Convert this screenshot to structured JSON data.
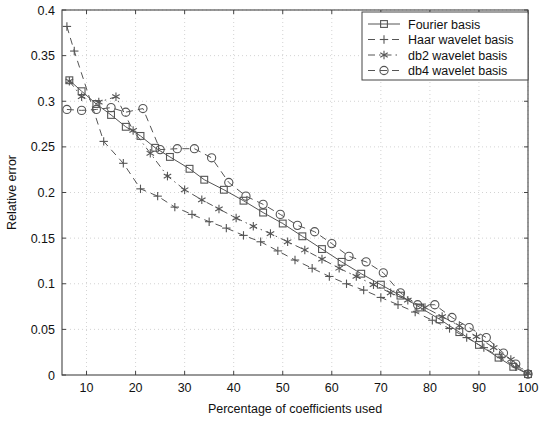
{
  "chart_data": {
    "type": "line",
    "title": "",
    "xlabel": "Percentage of coefficients used",
    "ylabel": "Relative error",
    "xlim": [
      5,
      100
    ],
    "ylim": [
      0,
      0.4
    ],
    "xticks": [
      10,
      20,
      30,
      40,
      50,
      60,
      70,
      80,
      90,
      100
    ],
    "xtick_labels": [
      "10",
      "20",
      "30",
      "40",
      "50",
      "60",
      "70",
      "80",
      "90",
      "100"
    ],
    "yticks": [
      0,
      0.05,
      0.1,
      0.15,
      0.2,
      0.25,
      0.3,
      0.35,
      0.4
    ],
    "ytick_labels": [
      "0",
      "0.05",
      "0.1",
      "0.15",
      "0.2",
      "0.25",
      "0.3",
      "0.35",
      "0.4"
    ],
    "grid": true,
    "grid_style": "dotted",
    "legend_position": "top-right",
    "line_color": "#555555",
    "grid_color": "#c8c8c8",
    "axis_color": "#444444",
    "series": [
      {
        "name": "Fourier basis",
        "marker": "square",
        "linestyle": "solid",
        "x": [
          6.5,
          9,
          12,
          15,
          18,
          21,
          24,
          27,
          31,
          34,
          38,
          42,
          46,
          50,
          54,
          58,
          62,
          66,
          70,
          74,
          78,
          82,
          86,
          90,
          94,
          97,
          100
        ],
        "y": [
          0.323,
          0.311,
          0.297,
          0.285,
          0.272,
          0.262,
          0.249,
          0.239,
          0.226,
          0.214,
          0.203,
          0.191,
          0.178,
          0.166,
          0.152,
          0.138,
          0.124,
          0.111,
          0.099,
          0.087,
          0.074,
          0.061,
          0.047,
          0.033,
          0.019,
          0.009,
          0.001
        ]
      },
      {
        "name": "Haar wavelet basis",
        "marker": "plus",
        "linestyle": "dashed",
        "x": [
          6,
          7.5,
          13.5,
          17.5,
          21,
          24.5,
          28,
          31.5,
          35,
          38.5,
          42,
          45.5,
          49,
          52.5,
          56,
          59.5,
          63,
          66.5,
          70,
          73.5,
          77,
          80.5,
          84,
          87.5,
          91,
          94.5,
          97.5,
          100
        ],
        "y": [
          0.382,
          0.355,
          0.256,
          0.232,
          0.204,
          0.196,
          0.184,
          0.176,
          0.168,
          0.161,
          0.153,
          0.146,
          0.136,
          0.126,
          0.117,
          0.108,
          0.1,
          0.093,
          0.085,
          0.077,
          0.069,
          0.06,
          0.051,
          0.041,
          0.03,
          0.019,
          0.009,
          0.001
        ]
      },
      {
        "name": "db2 wavelet basis",
        "marker": "star",
        "linestyle": "dashdot",
        "x": [
          6.5,
          9,
          12.5,
          16,
          19.5,
          23,
          26.5,
          30,
          33.5,
          37,
          40.5,
          44,
          47.5,
          51,
          54.5,
          58,
          61.5,
          65,
          68.5,
          72,
          75.5,
          79,
          82.5,
          86,
          89.5,
          93,
          96.5,
          100
        ],
        "y": [
          0.322,
          0.305,
          0.299,
          0.305,
          0.268,
          0.243,
          0.218,
          0.203,
          0.192,
          0.182,
          0.172,
          0.163,
          0.155,
          0.146,
          0.137,
          0.127,
          0.117,
          0.108,
          0.099,
          0.09,
          0.082,
          0.074,
          0.064,
          0.054,
          0.042,
          0.03,
          0.017,
          0.002
        ]
      },
      {
        "name": "db4 wavelet basis",
        "marker": "circle",
        "linestyle": "dashed",
        "x": [
          6,
          9,
          12,
          15,
          18,
          21.5,
          25,
          28.5,
          32,
          35.5,
          39,
          42.5,
          46,
          49.5,
          53,
          56.5,
          60,
          63.5,
          67,
          70.5,
          74,
          77.5,
          81,
          84.5,
          88,
          91.5,
          95,
          97.5,
          100
        ],
        "y": [
          0.291,
          0.29,
          0.291,
          0.293,
          0.288,
          0.292,
          0.247,
          0.248,
          0.248,
          0.238,
          0.211,
          0.196,
          0.187,
          0.176,
          0.164,
          0.157,
          0.144,
          0.13,
          0.124,
          0.112,
          0.09,
          0.077,
          0.077,
          0.063,
          0.052,
          0.041,
          0.024,
          0.012,
          0.001
        ]
      }
    ]
  },
  "legend": {
    "items": [
      {
        "label": "Fourier basis"
      },
      {
        "label": "Haar wavelet basis"
      },
      {
        "label": "db2 wavelet basis"
      },
      {
        "label": "db4 wavelet basis"
      }
    ]
  }
}
